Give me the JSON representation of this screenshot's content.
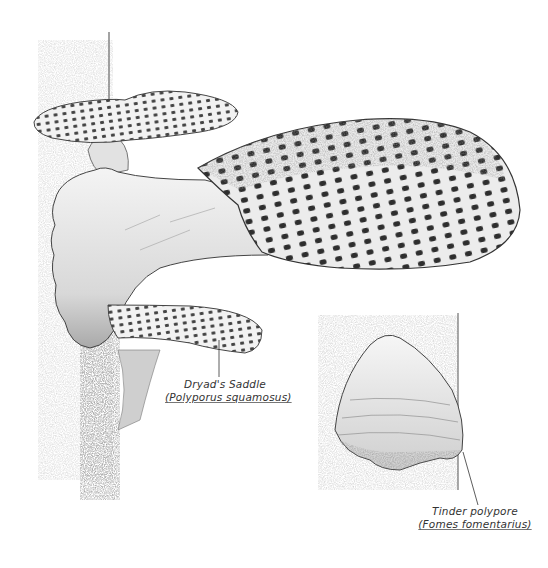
{
  "illustration": {
    "style": "pencil sketch",
    "colors": {
      "background": "#ffffff",
      "ink": "#333333",
      "shade": "#8a8a8a",
      "light": "#e6e6e6"
    },
    "specimens": [
      {
        "common_name": "Dryad's Saddle",
        "scientific_name": "(Polyporus squamosus)"
      },
      {
        "common_name": "Tinder polypore",
        "scientific_name": "(Fomes fomentarius)"
      }
    ]
  }
}
